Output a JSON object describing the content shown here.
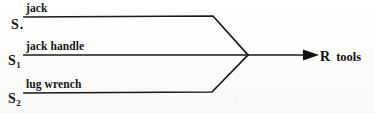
{
  "diagram": {
    "type": "merge-flow-diagram",
    "title": "",
    "stroke_color": "#1a1a1a",
    "background_color": "#fdfdfb",
    "sources": [
      {
        "id": "s0",
        "symbol": "S",
        "subscript": "",
        "suffix": ".",
        "edge_label": "jack"
      },
      {
        "id": "s1",
        "symbol": "S",
        "subscript": "1",
        "suffix": "",
        "edge_label": "jack handle"
      },
      {
        "id": "s2",
        "symbol": "S",
        "subscript": "2",
        "suffix": "",
        "edge_label": "lug wrench"
      }
    ],
    "target": {
      "id": "r",
      "symbol": "R",
      "label": "tools"
    },
    "arrow": {
      "head": "solid-triangle",
      "direction": "right"
    }
  }
}
